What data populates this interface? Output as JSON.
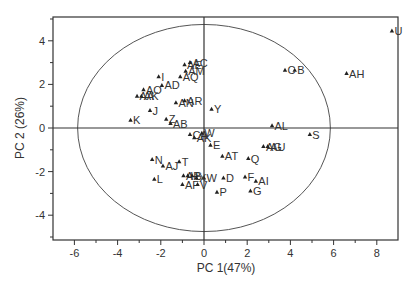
{
  "chart_data": {
    "type": "scatter",
    "title": "",
    "xlabel": "PC 1(47%)",
    "ylabel": "PC 2 (26%)",
    "xlim": [
      -6.8,
      8.9
    ],
    "ylim": [
      -5.1,
      5.1
    ],
    "xticks": [
      -6,
      -4,
      -2,
      0,
      2,
      4,
      6,
      8
    ],
    "yticks": [
      -4,
      -2,
      0,
      2,
      4
    ],
    "grid": false,
    "legend": null,
    "ellipse": {
      "cx": 0,
      "cy": 0,
      "rx": 5.85,
      "ry": 4.75,
      "description": "Hotelling T2 confidence ellipse"
    },
    "reference_lines": {
      "x": 0,
      "y": 0
    },
    "marker": "triangle",
    "points": [
      {
        "label": "U",
        "x": 8.7,
        "y": 4.45
      },
      {
        "label": "AH",
        "x": 6.6,
        "y": 2.5
      },
      {
        "label": "C",
        "x": 3.75,
        "y": 2.65
      },
      {
        "label": "B",
        "x": 4.2,
        "y": 2.65
      },
      {
        "label": "AL",
        "x": 3.15,
        "y": 0.1
      },
      {
        "label": "S",
        "x": 4.9,
        "y": -0.3
      },
      {
        "label": "AG",
        "x": 2.75,
        "y": -0.85
      },
      {
        "label": "AU",
        "x": 2.95,
        "y": -0.85
      },
      {
        "label": "Q",
        "x": 2.05,
        "y": -1.4
      },
      {
        "label": "F",
        "x": 1.9,
        "y": -2.25
      },
      {
        "label": "AI",
        "x": 2.4,
        "y": -2.45
      },
      {
        "label": "G",
        "x": 2.15,
        "y": -2.9
      },
      {
        "label": "AT",
        "x": 0.85,
        "y": -1.3
      },
      {
        "label": "E",
        "x": 0.3,
        "y": -0.8
      },
      {
        "label": "D",
        "x": 0.9,
        "y": -2.3
      },
      {
        "label": "P",
        "x": 0.6,
        "y": -2.95
      },
      {
        "label": "W",
        "x": 0.0,
        "y": -2.3
      },
      {
        "label": "Y",
        "x": 0.35,
        "y": 0.85
      },
      {
        "label": "AE",
        "x": -0.9,
        "y": 2.9
      },
      {
        "label": "AC",
        "x": -0.65,
        "y": 3.0
      },
      {
        "label": "AM",
        "x": -0.85,
        "y": 2.6
      },
      {
        "label": "AQ",
        "x": -1.1,
        "y": 2.35
      },
      {
        "label": "I",
        "x": -2.1,
        "y": 2.35
      },
      {
        "label": "AD",
        "x": -1.95,
        "y": 1.95
      },
      {
        "label": "AO",
        "x": -2.8,
        "y": 1.75
      },
      {
        "label": "AA",
        "x": -3.1,
        "y": 1.45
      },
      {
        "label": "AK",
        "x": -2.9,
        "y": 1.45
      },
      {
        "label": "AN",
        "x": -1.3,
        "y": 1.15
      },
      {
        "label": "AR",
        "x": -0.9,
        "y": 1.25
      },
      {
        "label": "J",
        "x": -2.5,
        "y": 0.8
      },
      {
        "label": "K",
        "x": -3.4,
        "y": 0.35
      },
      {
        "label": "Z",
        "x": -1.75,
        "y": 0.4
      },
      {
        "label": "AB",
        "x": -1.55,
        "y": 0.2
      },
      {
        "label": "CA",
        "x": -0.65,
        "y": -0.3
      },
      {
        "label": "AS",
        "x": -0.45,
        "y": -0.45
      },
      {
        "label": "W2",
        "x": -0.1,
        "y": -0.25
      },
      {
        "label": "N",
        "x": -2.4,
        "y": -1.45
      },
      {
        "label": "AJ",
        "x": -1.9,
        "y": -1.75
      },
      {
        "label": "T",
        "x": -1.15,
        "y": -1.55
      },
      {
        "label": "L",
        "x": -2.3,
        "y": -2.35
      },
      {
        "label": "AF",
        "x": -1.0,
        "y": -2.6
      },
      {
        "label": "V",
        "x": -0.3,
        "y": -2.6
      },
      {
        "label": "AP",
        "x": -0.95,
        "y": -2.2
      },
      {
        "label": "H",
        "x": -0.75,
        "y": -2.2
      },
      {
        "label": "R",
        "x": -0.55,
        "y": -2.2
      },
      {
        "label": "X",
        "x": -0.35,
        "y": -2.3
      }
    ]
  },
  "display_labels": {
    "U": "U",
    "AH": "AH",
    "C": "C",
    "B": "B",
    "AL": "AL",
    "S": "S",
    "AG": "AG",
    "AU": "AU",
    "Q": "Q",
    "F": "F",
    "AI": "AI",
    "G": "G",
    "AT": "AT",
    "E": "E",
    "D": "D",
    "P": "P",
    "W": "W",
    "Y": "Y",
    "AE": "AE",
    "AC": "AC",
    "AM": "AM",
    "AQ": "AQ",
    "I": "I",
    "AD": "AD",
    "AO": "AO",
    "AA": "AA",
    "AK": "AK",
    "AN": "AN",
    "AR": "AR",
    "J": "J",
    "K": "K",
    "Z": "Z",
    "AB": "AB",
    "CA": "CA",
    "AS": "AK",
    "W2": "W",
    "N": "N",
    "AJ": "AJ",
    "T": "T",
    "L": "L",
    "AF": "AF",
    "V": "V",
    "AP": "AP",
    "H": "H",
    "R": "S",
    "X": "X"
  },
  "style": {
    "axis_color": "#333333",
    "ellipse_color": "#555555",
    "marker_color": "#222222",
    "text_color": "#333333"
  }
}
